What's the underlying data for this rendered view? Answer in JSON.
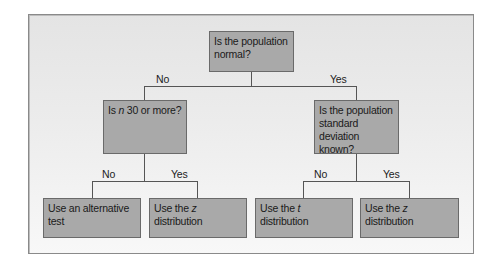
{
  "diagram": {
    "type": "decision-tree",
    "root": {
      "text": "Is the population normal?",
      "branches": [
        {
          "label": "No"
        },
        {
          "label": "Yes"
        }
      ]
    },
    "q_left": {
      "pre": "Is ",
      "var": "n",
      "post": " 30 or more?"
    },
    "q_right": {
      "text": "Is the population standard deviation known?"
    },
    "left_branches": {
      "no": "No",
      "yes": "Yes"
    },
    "right_branches": {
      "no": "No",
      "yes": "Yes"
    },
    "leaves": [
      {
        "pre": "Use an alternative test",
        "var": "",
        "post": ""
      },
      {
        "pre": "Use the ",
        "var": "z",
        "post": " distribution"
      },
      {
        "pre": "Use the ",
        "var": "t",
        "post": " distribution"
      },
      {
        "pre": "Use the ",
        "var": "z",
        "post": " distribution"
      }
    ]
  }
}
